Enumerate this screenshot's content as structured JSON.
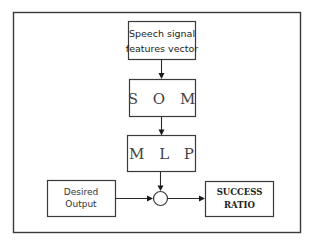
{
  "diagram": {
    "nodes": {
      "input": {
        "line1": "Speech signal",
        "line2": "features vector"
      },
      "som": {
        "label": "S O M"
      },
      "mlp": {
        "label": "M L P"
      },
      "desired": {
        "line1": "Desired",
        "line2": "Output"
      },
      "comparator": {
        "label": ""
      },
      "success": {
        "line1": "SUCCESS",
        "line2": "RATIO"
      }
    },
    "edges": [
      {
        "from": "input",
        "to": "som"
      },
      {
        "from": "som",
        "to": "mlp"
      },
      {
        "from": "mlp",
        "to": "comparator"
      },
      {
        "from": "desired",
        "to": "comparator"
      },
      {
        "from": "comparator",
        "to": "success"
      }
    ]
  }
}
